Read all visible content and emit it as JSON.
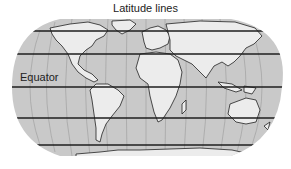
{
  "title": "Latitude lines",
  "labels": {
    "equator": "Equator"
  },
  "map": {
    "projection": "rounded world map",
    "colors": {
      "ocean": "#c9c9c9",
      "land": "#ececec",
      "coastline": "#222222",
      "meridian": "#9a9a9a",
      "latitude_line": "#1e1e1e",
      "background": "#ffffff"
    },
    "latitude_lines": [
      {
        "name": "60N"
      },
      {
        "name": "30N"
      },
      {
        "name": "Equator"
      },
      {
        "name": "30S"
      },
      {
        "name": "60S"
      }
    ],
    "continents": [
      "North America",
      "South America",
      "Europe",
      "Africa",
      "Asia",
      "Australia",
      "Antarctica",
      "Greenland"
    ]
  }
}
